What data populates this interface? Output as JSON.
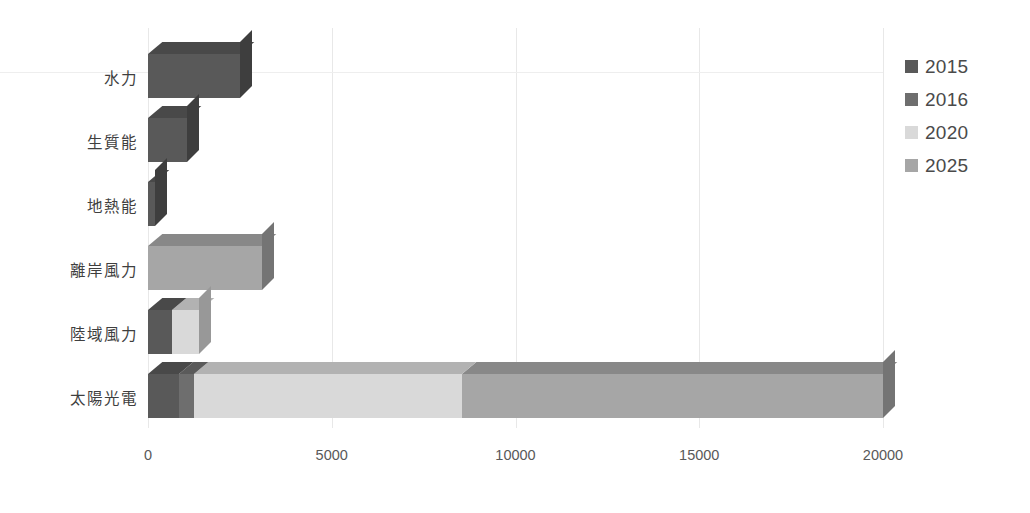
{
  "chart_data": {
    "type": "bar",
    "orientation": "horizontal",
    "stacked": true,
    "style": "3d",
    "title": "",
    "xlabel": "",
    "ylabel": "",
    "xlim": [
      0,
      20000
    ],
    "xticks": [
      "0",
      "5000",
      "10000",
      "15000",
      "20000"
    ],
    "xtick_values": [
      0,
      5000,
      10000,
      15000,
      20000
    ],
    "grid": "vertical",
    "legend_position": "right",
    "categories": [
      "水力",
      "生質能",
      "地熱能",
      "離岸風力",
      "陸域風力",
      "太陽光電"
    ],
    "series": [
      {
        "name": "2015",
        "color": "#595959",
        "values": [
          2500,
          1050,
          200,
          0,
          647,
          840
        ]
      },
      {
        "name": "2016",
        "color": "#6e6e6e",
        "values": [
          0,
          0,
          0,
          0,
          0,
          400
        ]
      },
      {
        "name": "2020",
        "color": "#d9d9d9",
        "values": [
          0,
          0,
          0,
          0,
          750,
          7300
        ]
      },
      {
        "name": "2025",
        "color": "#a6a6a6",
        "values": [
          0,
          0,
          0,
          3100,
          0,
          11460
        ]
      }
    ],
    "totals": [
      2500,
      1050,
      200,
      3100,
      1397,
      20000
    ]
  },
  "legend": {
    "entries": [
      {
        "label": "2015",
        "color": "#595959"
      },
      {
        "label": "2016",
        "color": "#6e6e6e"
      },
      {
        "label": "2020",
        "color": "#d9d9d9"
      },
      {
        "label": "2025",
        "color": "#a6a6a6"
      }
    ]
  },
  "axis": {
    "x_ticks": [
      "0",
      "5000",
      "10000",
      "15000",
      "20000"
    ]
  },
  "categories": {
    "items": [
      "水力",
      "生質能",
      "地熱能",
      "離岸風力",
      "陸域風力",
      "太陽光電"
    ]
  }
}
